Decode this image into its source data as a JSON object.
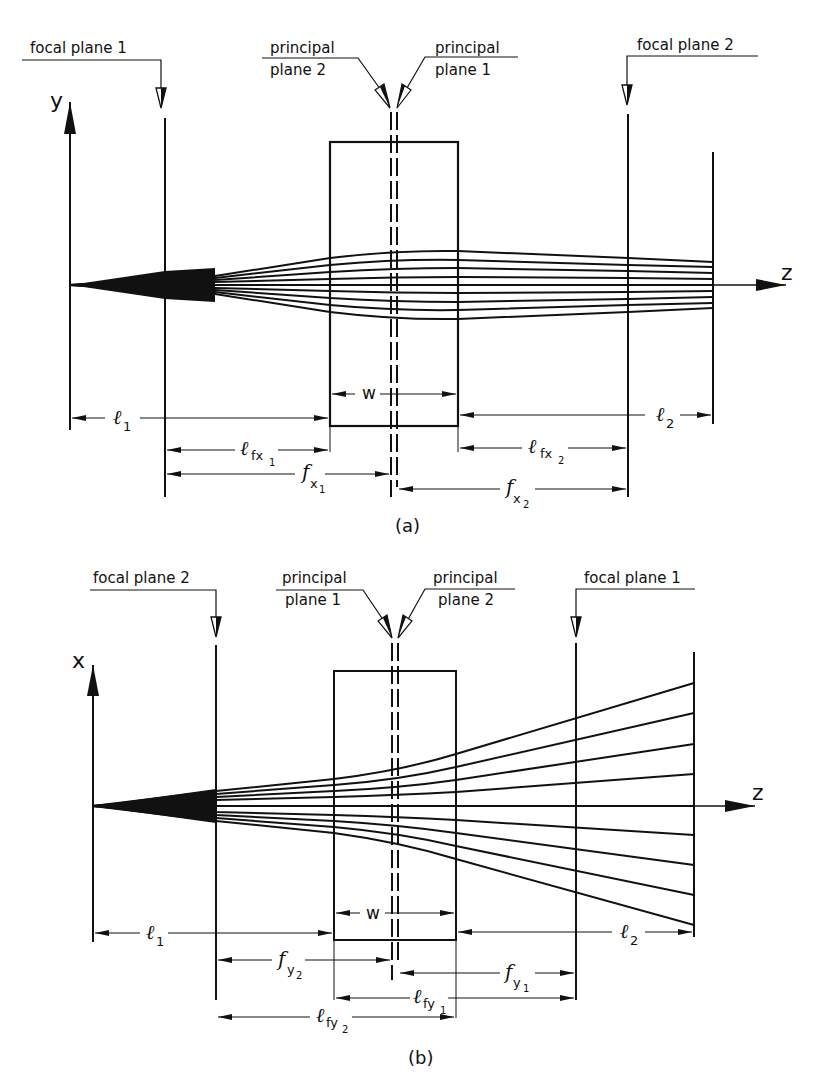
{
  "diagram": {
    "panel_a": {
      "caption": "(a)",
      "axis_vertical": "y",
      "axis_horizontal": "z",
      "callouts": {
        "focal_plane_left": "focal plane 1",
        "principal_left_line1": "principal",
        "principal_left_line2": "plane 2",
        "principal_right_line1": "principal",
        "principal_right_line2": "plane 1",
        "focal_plane_right": "focal plane 2"
      },
      "dimensions": {
        "l1": {
          "main": "ℓ",
          "sub": "1"
        },
        "w": {
          "main": "w"
        },
        "l2": {
          "main": "ℓ",
          "sub": "2"
        },
        "lfx1": {
          "main": "ℓ",
          "sub": "fx",
          "subsub": "1"
        },
        "lfx2": {
          "main": "ℓ",
          "sub": "fx",
          "subsub": "2"
        },
        "fx1": {
          "main": "f",
          "sub": "x",
          "subsub": "1"
        },
        "fx2": {
          "main": "f",
          "sub": "x",
          "subsub": "2"
        }
      },
      "beam": "converging-collimated"
    },
    "panel_b": {
      "caption": "(b)",
      "axis_vertical": "x",
      "axis_horizontal": "z",
      "callouts": {
        "focal_plane_left": "focal plane 2",
        "principal_left_line1": "principal",
        "principal_left_line2": "plane 1",
        "principal_right_line1": "principal",
        "principal_right_line2": "plane 2",
        "focal_plane_right": "focal plane 1"
      },
      "dimensions": {
        "l1": {
          "main": "ℓ",
          "sub": "1"
        },
        "w": {
          "main": "w"
        },
        "l2": {
          "main": "ℓ",
          "sub": "2"
        },
        "fy2": {
          "main": "f",
          "sub": "y",
          "subsub": "2"
        },
        "fy1": {
          "main": "f",
          "sub": "y",
          "subsub": "1"
        },
        "lfy1": {
          "main": "ℓ",
          "sub": "fy",
          "subsub": "1"
        },
        "lfy2": {
          "main": "ℓ",
          "sub": "fy",
          "subsub": "2"
        }
      },
      "beam": "diverging"
    }
  }
}
